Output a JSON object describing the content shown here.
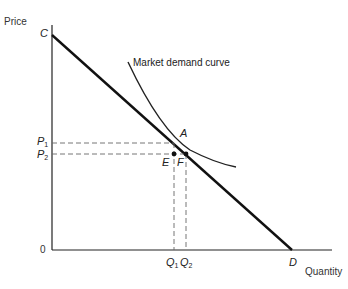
{
  "axes": {
    "y_label": "Price",
    "x_label": "Quantity",
    "origin": "0"
  },
  "points": {
    "C": "C",
    "D": "D",
    "A": "A",
    "E": "E",
    "F": "F"
  },
  "ticks": {
    "P1": {
      "main": "P",
      "sub": "1"
    },
    "P2": {
      "main": "P",
      "sub": "2"
    },
    "Q1": {
      "main": "Q",
      "sub": "1"
    },
    "Q2": {
      "main": "Q",
      "sub": "2"
    }
  },
  "curve_label": "Market demand curve",
  "colors": {
    "line": "#1a1a1a",
    "dash": "#555555"
  }
}
